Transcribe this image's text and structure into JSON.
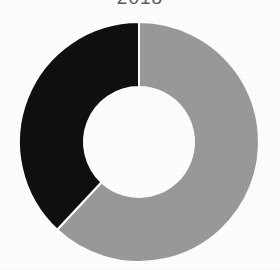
{
  "figure": {
    "title": "2018",
    "background_color": "#ffffff",
    "title_color": "#58585a",
    "width": 280,
    "height": 270
  },
  "chart_data": {
    "type": "pie",
    "variant": "donut",
    "title": "2018",
    "subtitle": "",
    "xlabel": "",
    "ylabel": "",
    "legend": "none",
    "grid": false,
    "start_angle_deg": 0,
    "direction": "clockwise",
    "center": {
      "x": 139,
      "y": 142
    },
    "outer_radius": 120,
    "inner_radius": 55,
    "hole_color": "#ffffff",
    "separator_color": "#ffffff",
    "separator_width": 2,
    "categories": [
      "Segment 1",
      "Segment 2"
    ],
    "values": [
      62,
      38
    ],
    "units": "percent",
    "slices": [
      {
        "label": "Segment 1",
        "value": 62,
        "percent": 62,
        "color": "#9a9a9a",
        "start_angle_deg": 0,
        "end_angle_deg": 223,
        "data_label": ""
      },
      {
        "label": "Segment 2",
        "value": 38,
        "percent": 38,
        "color": "#101010",
        "start_angle_deg": 223,
        "end_angle_deg": 360,
        "data_label": ""
      }
    ],
    "annotations": []
  }
}
